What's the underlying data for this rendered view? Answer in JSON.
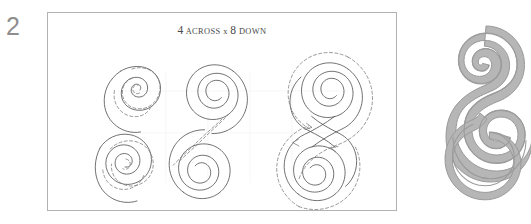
{
  "page": {
    "figure_number": "2",
    "background_color": "#ffffff"
  },
  "frame": {
    "caption_leading_number": "4",
    "caption_across_word": "ACROSS",
    "caption_times_symbol": "x",
    "caption_trailing_number": "8",
    "caption_down_word": "DOWN",
    "caption_full": "4 ACROSS x 8 DOWN",
    "border_color": "#b0b2b3",
    "background_color": "#ffffff"
  },
  "stages": [
    {
      "name": "stage-single-spiral-top",
      "label": "single clockwise spiral with dashed stitch guide",
      "column": 1,
      "row": 1,
      "line_style": "solid-with-dashed-overlay"
    },
    {
      "name": "stage-single-spiral-bottom",
      "label": "mirrored counter-clockwise spiral with dashed stitch guide",
      "column": 1,
      "row": 2,
      "line_style": "solid-with-dashed-overlay"
    },
    {
      "name": "stage-double-spiral-joined",
      "label": "two spirals joined by dashed diagonal connector",
      "column": 2,
      "row": 1,
      "line_style": "solid-with-dashed-connector"
    },
    {
      "name": "stage-double-spiral-outlined",
      "label": "completed S double spiral with dashed travel outline and direction arrows",
      "column": 3,
      "row": 1,
      "line_style": "solid-with-dashed-outline"
    }
  ],
  "finished_motif": {
    "name": "finished-s-spiral-motif",
    "label": "filled S double spiral motif",
    "fill_color": "#b6b6b6",
    "line_color": "#9a9a9a"
  },
  "colors": {
    "figure_number": "#8e8e8e",
    "caption_text": "#4a4a4a",
    "solid_stroke": "#575757",
    "dashed_stroke": "#7d7d7d",
    "grid_stroke": "#f0f0f0"
  }
}
